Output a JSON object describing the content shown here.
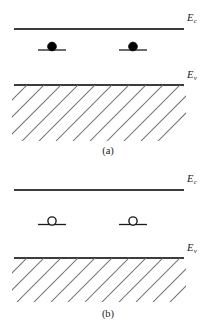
{
  "figure": {
    "background_color": "#ffffff",
    "line_color": "#3c3c3c",
    "carrier_fill_color": "#000000",
    "hatch_color": "#6e6e6e"
  },
  "panels": [
    {
      "id": "a",
      "caption": "(a)",
      "conduction_band": {
        "label_main": "E",
        "label_sub": "c",
        "line_y": 29,
        "x_start": 14,
        "x_end": 184
      },
      "valence_band": {
        "label_main": "E",
        "label_sub": "v",
        "line_y": 85,
        "x_start": 14,
        "x_end": 184
      },
      "carriers": {
        "type": "electron",
        "fill": "filled",
        "count": 2,
        "radius": 4.2,
        "positions_x": [
          52,
          133
        ],
        "y": 47,
        "tick_half_width": 14
      },
      "hatching": {
        "direction": "lower-left-to-upper-right",
        "top_y": 85,
        "bottom_y": 141,
        "count": 12,
        "spacing": 17
      }
    },
    {
      "id": "b",
      "caption": "(b)",
      "conduction_band": {
        "label_main": "E",
        "label_sub": "c",
        "line_y": 190,
        "x_start": 14,
        "x_end": 184
      },
      "valence_band": {
        "label_main": "E",
        "label_sub": "v",
        "line_y": 258,
        "x_start": 14,
        "x_end": 184
      },
      "carriers": {
        "type": "hole",
        "fill": "open",
        "count": 2,
        "radius": 4.2,
        "positions_x": [
          52,
          133
        ],
        "y": 221,
        "tick_half_width": 14
      },
      "hatching": {
        "direction": "lower-left-to-upper-right",
        "top_y": 258,
        "bottom_y": 302,
        "count": 12,
        "spacing": 17
      }
    }
  ]
}
